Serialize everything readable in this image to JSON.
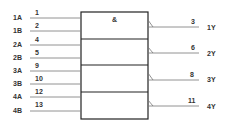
{
  "diagram": {
    "gate_symbol": "&",
    "inputs": [
      {
        "label": "1A",
        "pin": "1"
      },
      {
        "label": "1B",
        "pin": "2"
      },
      {
        "label": "2A",
        "pin": "4"
      },
      {
        "label": "2B",
        "pin": "5"
      },
      {
        "label": "3A",
        "pin": "9"
      },
      {
        "label": "3B",
        "pin": "10"
      },
      {
        "label": "4A",
        "pin": "12"
      },
      {
        "label": "4B",
        "pin": "13"
      }
    ],
    "outputs": [
      {
        "label": "1Y",
        "pin": "3"
      },
      {
        "label": "2Y",
        "pin": "6"
      },
      {
        "label": "3Y",
        "pin": "8"
      },
      {
        "label": "4Y",
        "pin": "11"
      }
    ]
  }
}
